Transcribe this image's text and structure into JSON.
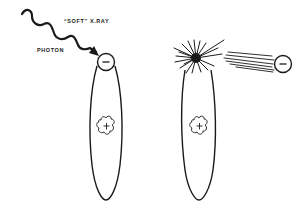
{
  "labels": {
    "xray": "“SOFT” X.RAY",
    "photon": "PHOTON"
  },
  "symbols": {
    "electron": "−",
    "nucleus": "+"
  },
  "panels": [
    {
      "name": "before",
      "description": "Soft X-ray photon approaching outer electron of atom"
    },
    {
      "name": "after",
      "description": "Photon absorbed, electron ejected from atom"
    }
  ],
  "colors": {
    "ink": "#1a1a1a",
    "background": "#ffffff"
  }
}
